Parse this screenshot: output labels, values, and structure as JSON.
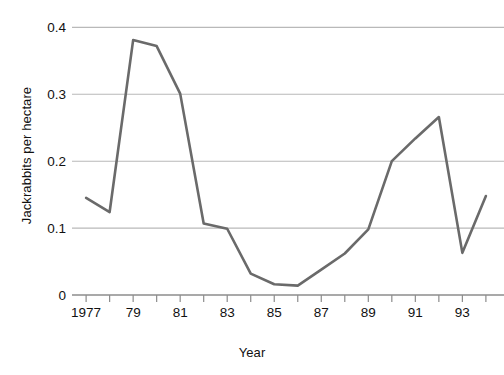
{
  "chart_data": {
    "type": "line",
    "title": "",
    "xlabel": "Year",
    "ylabel": "Jackrabbits per hectare",
    "xlim": [
      1976.4,
      1994.6
    ],
    "ylim": [
      0,
      0.42
    ],
    "grid": "horizontal",
    "legend": "none",
    "line_color": "#6a6a6a",
    "grid_color": "#b9b9b9",
    "axis_color": "#8c8c8c",
    "x": [
      1977,
      1978,
      1979,
      1980,
      1981,
      1982,
      1983,
      1984,
      1985,
      1986,
      1987,
      1988,
      1989,
      1990,
      1991,
      1992,
      1993,
      1994
    ],
    "values": [
      0.145,
      0.124,
      0.381,
      0.372,
      0.301,
      0.107,
      0.099,
      0.032,
      0.016,
      0.014,
      0.038,
      0.062,
      0.098,
      0.2,
      0.234,
      0.266,
      0.063,
      0.148
    ],
    "ytick_values": [
      0,
      0.1,
      0.2,
      0.3,
      0.4
    ],
    "ytick_labels": [
      "0",
      "0.1",
      "0.2",
      "0.3",
      "0.4"
    ],
    "xtick_values": [
      1977,
      1978,
      1979,
      1980,
      1981,
      1982,
      1983,
      1984,
      1985,
      1986,
      1987,
      1988,
      1989,
      1990,
      1991,
      1992,
      1993,
      1994
    ],
    "xtick_labels": [
      "1977",
      "",
      "79",
      "",
      "81",
      "",
      "83",
      "",
      "85",
      "",
      "87",
      "",
      "89",
      "",
      "91",
      "",
      "93",
      ""
    ]
  }
}
